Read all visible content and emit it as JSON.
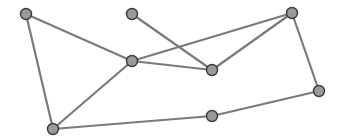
{
  "diagram": {
    "type": "undirected-graph",
    "width": 342,
    "height": 138,
    "colors": {
      "background": "#ffffff",
      "edge": "#7a7a7a",
      "node_fill": "#9a9a9a",
      "node_stroke": "#3a3a3a"
    },
    "node_radius": 5.5,
    "nodes": [
      {
        "id": "A",
        "x": 26,
        "y": 14
      },
      {
        "id": "B",
        "x": 132,
        "y": 14
      },
      {
        "id": "C",
        "x": 132,
        "y": 61
      },
      {
        "id": "D",
        "x": 292,
        "y": 13
      },
      {
        "id": "E",
        "x": 212,
        "y": 70
      },
      {
        "id": "F",
        "x": 319,
        "y": 91
      },
      {
        "id": "G",
        "x": 212,
        "y": 116
      },
      {
        "id": "H",
        "x": 53,
        "y": 129
      }
    ],
    "edges": [
      [
        "A",
        "B"
      ],
      [
        "A",
        "C"
      ],
      [
        "A",
        "H"
      ],
      [
        "B",
        "C"
      ],
      [
        "B",
        "E"
      ],
      [
        "C",
        "D"
      ],
      [
        "C",
        "E"
      ],
      [
        "C",
        "H"
      ],
      [
        "D",
        "E"
      ],
      [
        "D",
        "F"
      ],
      [
        "E",
        "G"
      ],
      [
        "F",
        "G"
      ],
      [
        "H",
        "G"
      ]
    ]
  }
}
